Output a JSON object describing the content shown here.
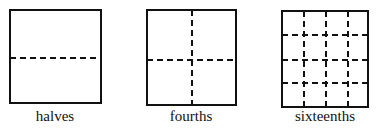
{
  "figures": [
    {
      "label": "halves",
      "divisions": 2,
      "rows": 2,
      "cols": 1
    },
    {
      "label": "fourths",
      "divisions": 4,
      "rows": 2,
      "cols": 2
    },
    {
      "label": "sixteenths",
      "divisions": 16,
      "rows": 4,
      "cols": 4
    }
  ]
}
